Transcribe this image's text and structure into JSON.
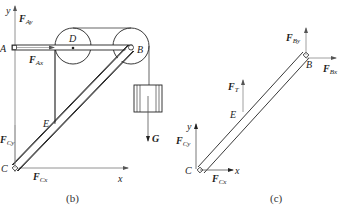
{
  "figure_b": {
    "caption": "(b)",
    "points": {
      "A": "A",
      "B": "B",
      "C": "C",
      "D": "D",
      "E": "E"
    },
    "axes": {
      "x": "x",
      "y": "y"
    },
    "forces": {
      "F_Ay": {
        "main": "F",
        "sub": "Ay"
      },
      "F_Ax": {
        "main": "F",
        "sub": "Ax"
      },
      "F_Cy": {
        "main": "F",
        "sub": "Cy"
      },
      "F_Cx": {
        "main": "F",
        "sub": "Cx"
      },
      "G": {
        "main": "G"
      }
    }
  },
  "figure_c": {
    "caption": "(c)",
    "points": {
      "B": "B",
      "C": "C",
      "E": "E"
    },
    "axes": {
      "x": "x",
      "y": "y"
    },
    "forces": {
      "F_By": {
        "main": "F",
        "sub": "By"
      },
      "F_Bx": {
        "main": "F",
        "sub": "Bx"
      },
      "F_T": {
        "main": "F",
        "sub": "T"
      },
      "F_Cy": {
        "main": "F",
        "sub": "Cy"
      },
      "F_Cx": {
        "main": "F",
        "sub": "Cx"
      }
    }
  },
  "colors": {
    "line": "#222222",
    "arrow": "#888888",
    "label": "#222222"
  }
}
